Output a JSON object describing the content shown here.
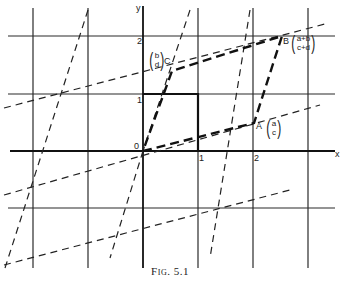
{
  "figure": {
    "caption_prefix": "Fig.",
    "caption_number": "5.1",
    "axes": {
      "x_label": "x",
      "y_label": "y",
      "origin_label": "0"
    },
    "x_ticks": [
      "1",
      "2"
    ],
    "y_ticks": [
      "1",
      "2"
    ],
    "points": {
      "A": {
        "label": "A",
        "vector_top": "a",
        "vector_bottom": "c"
      },
      "B": {
        "label": "B",
        "vector_top": "a+b",
        "vector_bottom": "c+d"
      },
      "C": {
        "label": "C",
        "vector_top": "b",
        "vector_bottom": "d"
      }
    },
    "colors": {
      "line": "#1a1a1a",
      "background": "#ffffff"
    }
  }
}
